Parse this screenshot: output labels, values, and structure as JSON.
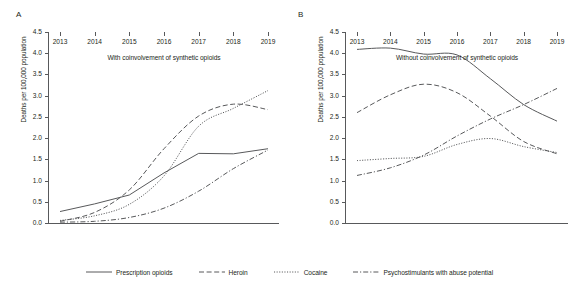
{
  "chart_data": {
    "type": "line",
    "title": "",
    "panels": [
      {
        "label": "A",
        "xlabel": "With coinvolvement of synthetic opioids",
        "ylabel": "Deaths per 100,000 population",
        "x": [
          2013,
          2014,
          2015,
          2016,
          2017,
          2018,
          2019
        ],
        "xticklabels": [
          "2013",
          "2014",
          "2015",
          "2016",
          "2017",
          "2018",
          "2019"
        ],
        "yticklabels": [
          "0.0",
          "0.5",
          "1.0",
          "1.5",
          "2.0",
          "2.5",
          "3.0",
          "3.5",
          "4.0",
          "4.5"
        ],
        "ylim": [
          0.0,
          4.5
        ],
        "ytickstep": 0.5,
        "grid": false,
        "series": [
          {
            "name": "Prescription opioids",
            "style": "solid",
            "values": [
              0.27,
              0.45,
              0.66,
              1.18,
              1.64,
              1.63,
              1.75
            ]
          },
          {
            "name": "Heroin",
            "style": "dashed",
            "values": [
              0.04,
              0.25,
              0.78,
              1.75,
              2.52,
              2.8,
              2.67
            ]
          },
          {
            "name": "Cocaine",
            "style": "dotted",
            "values": [
              0.06,
              0.17,
              0.44,
              1.11,
              2.28,
              2.7,
              3.12
            ]
          },
          {
            "name": "Psychostimulants with abuse potential",
            "style": "dashdot",
            "values": [
              0.02,
              0.04,
              0.13,
              0.35,
              0.75,
              1.28,
              1.72
            ]
          }
        ]
      },
      {
        "label": "B",
        "xlabel": "Without coinvolvement of synthetic opioids",
        "ylabel": "Deaths per 100,000 population",
        "x": [
          2013,
          2014,
          2015,
          2016,
          2017,
          2018,
          2019
        ],
        "xticklabels": [
          "2013",
          "2014",
          "2015",
          "2016",
          "2017",
          "2018",
          "2019"
        ],
        "yticklabels": [
          "0.0",
          "0.5",
          "1.0",
          "1.5",
          "2.0",
          "2.5",
          "3.0",
          "3.5",
          "4.0",
          "4.5"
        ],
        "ylim": [
          0.0,
          4.5
        ],
        "ytickstep": 0.5,
        "grid": false,
        "series": [
          {
            "name": "Prescription opioids",
            "style": "solid",
            "values": [
              4.09,
              4.12,
              3.98,
              3.96,
              3.4,
              2.79,
              2.4
            ]
          },
          {
            "name": "Heroin",
            "style": "dashed",
            "values": [
              2.6,
              3.02,
              3.27,
              3.07,
              2.52,
              1.92,
              1.63
            ]
          },
          {
            "name": "Cocaine",
            "style": "dotted",
            "values": [
              1.47,
              1.52,
              1.57,
              1.85,
              1.99,
              1.8,
              1.66
            ]
          },
          {
            "name": "Psychostimulants with abuse potential",
            "style": "dashdot",
            "values": [
              1.12,
              1.3,
              1.6,
              2.05,
              2.45,
              2.79,
              3.17
            ]
          }
        ]
      }
    ],
    "legend": {
      "position": "bottom-center",
      "entries": [
        {
          "label": "Prescription opioids",
          "style": "solid"
        },
        {
          "label": "Heroin",
          "style": "dashed"
        },
        {
          "label": "Cocaine",
          "style": "dotted"
        },
        {
          "label": "Psychostimulants with abuse potential",
          "style": "dashdot"
        }
      ]
    },
    "colors": {
      "line": "#58595b",
      "axis": "#58595b",
      "text": "#231f20",
      "background": "#ffffff"
    }
  }
}
